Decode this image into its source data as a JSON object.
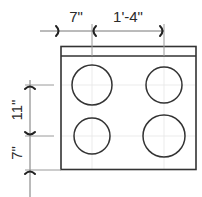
{
  "diagram": {
    "type": "cooktop-plan-dimensions",
    "colors": {
      "outline": "#333333",
      "dimension_line": "#777777",
      "extension_line": "#9a9a9a",
      "text": "#2a2a2a",
      "background": "#ffffff"
    },
    "dimensions": {
      "top_left": {
        "label": "7\""
      },
      "top_right": {
        "label": "1'-4\""
      },
      "side_upper": {
        "label": "11\""
      },
      "side_lower": {
        "label": "7\""
      }
    },
    "burners": [
      {
        "name": "rear-left",
        "cx": 92,
        "cy": 85,
        "r": 20
      },
      {
        "name": "rear-right",
        "cx": 164,
        "cy": 85,
        "r": 18
      },
      {
        "name": "front-left",
        "cx": 92,
        "cy": 136,
        "r": 18
      },
      {
        "name": "front-right",
        "cx": 164,
        "cy": 136,
        "r": 21
      }
    ]
  }
}
